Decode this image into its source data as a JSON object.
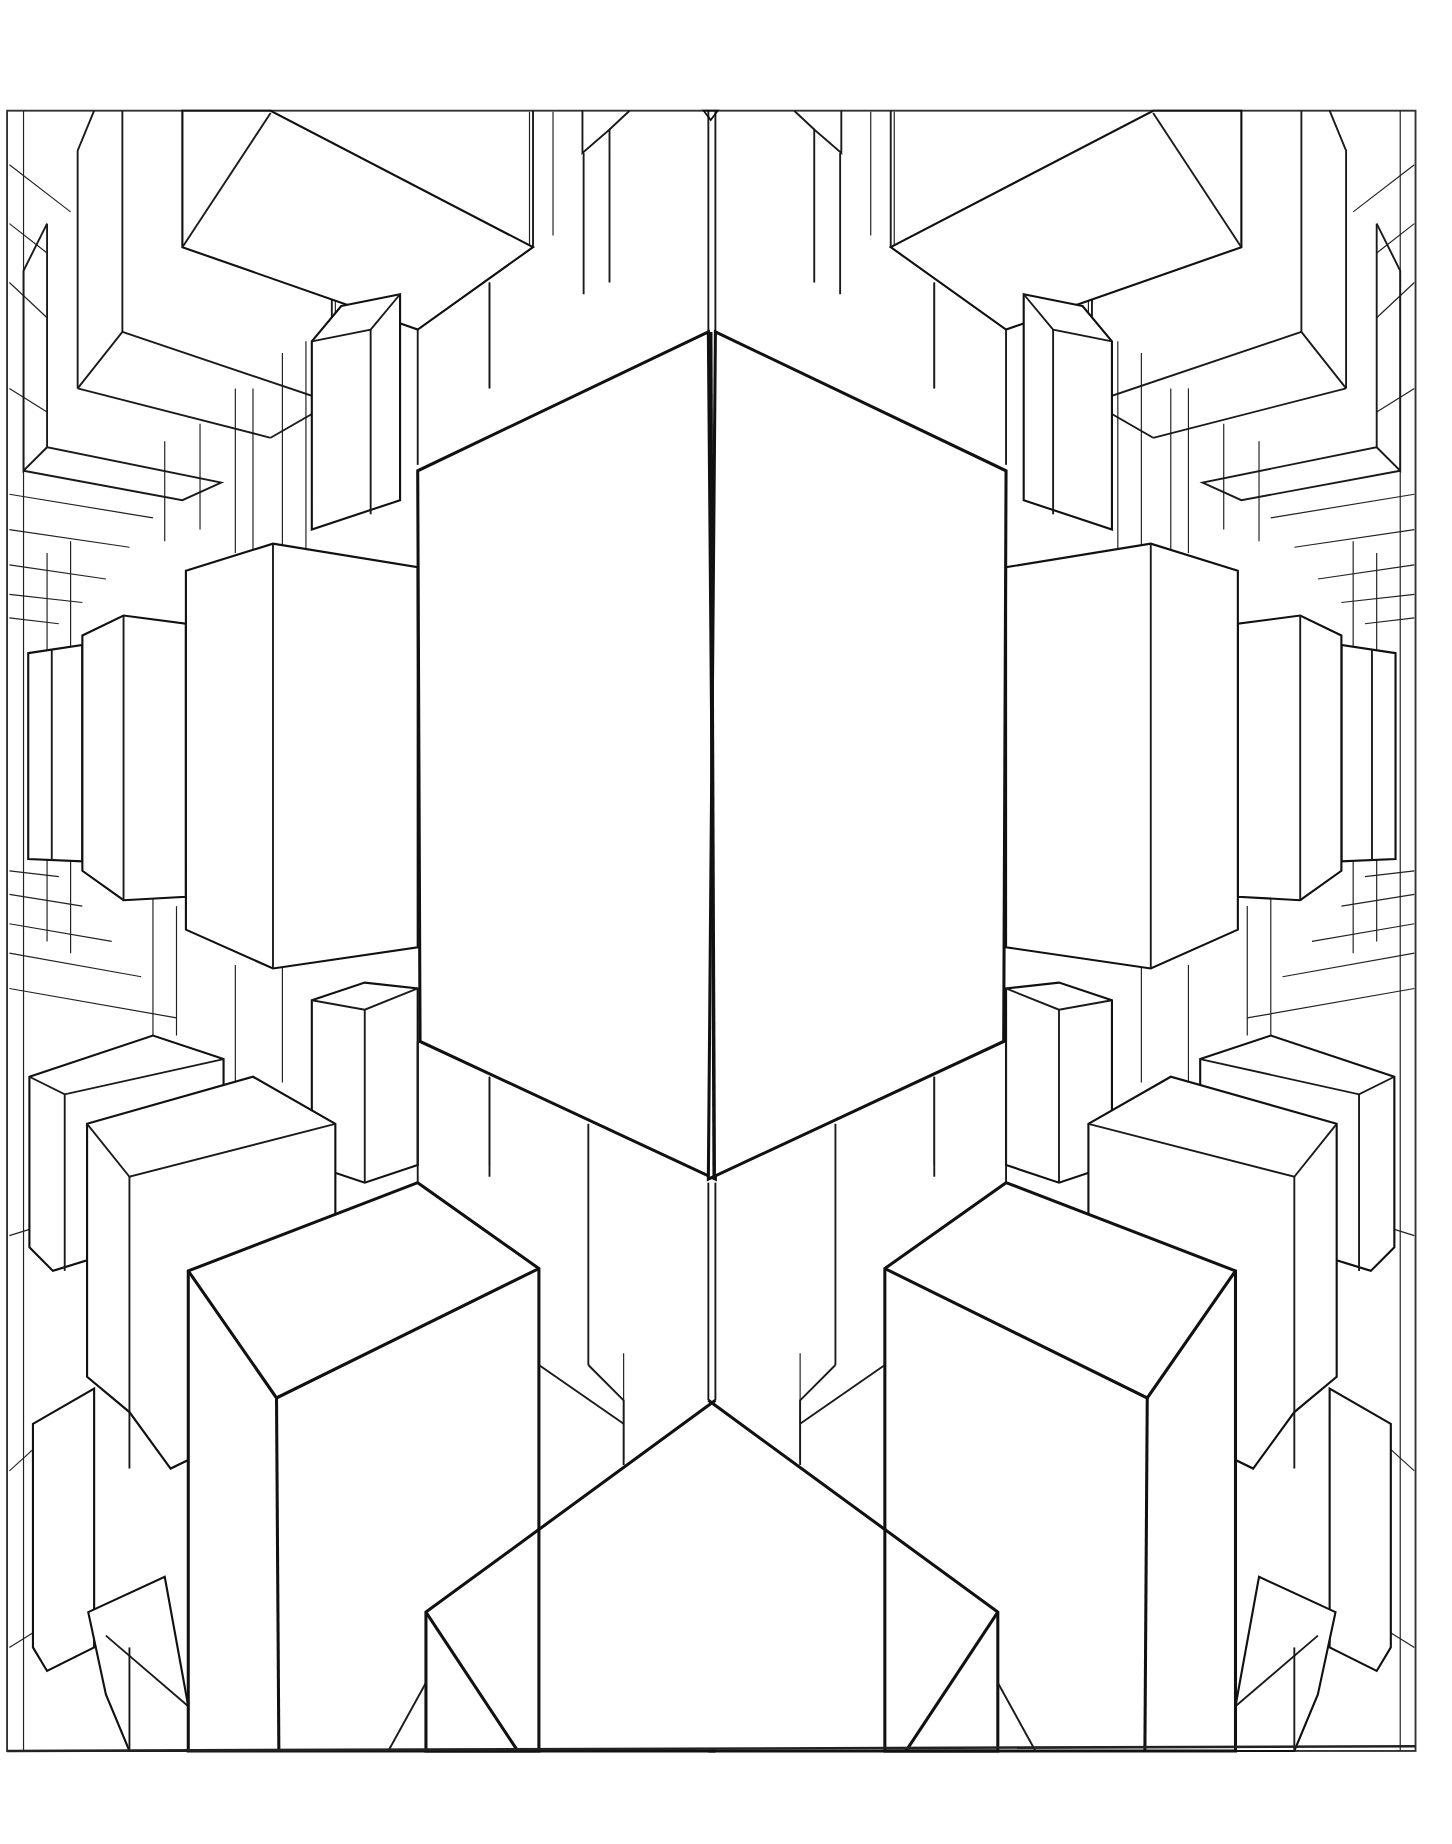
{
  "artwork": {
    "type": "line-art coloring page",
    "subject": "symmetric perspective view of 3D rectangular boxes receding toward a vanishing point",
    "colors": {
      "background": "#ffffff",
      "line": "#111111"
    }
  }
}
